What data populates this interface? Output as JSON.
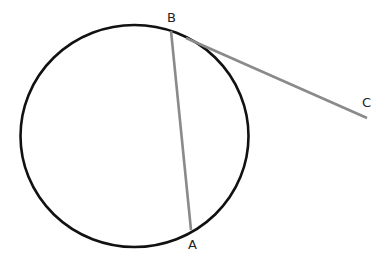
{
  "diagram": {
    "type": "geometry",
    "colors": {
      "circle_stroke": "#111111",
      "segment_stroke": "#8a8a8a",
      "label": "#222222",
      "background": "#ffffff"
    },
    "circle": {
      "cx": 134.5,
      "cy": 136,
      "rx": 114,
      "ry": 111
    },
    "points": [
      {
        "name": "B",
        "x": 171,
        "y": 31,
        "label_x": 167,
        "label_y": 22
      },
      {
        "name": "A",
        "x": 191,
        "y": 230,
        "label_x": 188,
        "label_y": 249
      },
      {
        "name": "C",
        "x": 367,
        "y": 118,
        "label_x": 362,
        "label_y": 107
      }
    ],
    "segments": [
      {
        "name": "chord-BA",
        "from": "B",
        "to": "A"
      },
      {
        "name": "tangent-BC",
        "from": "B",
        "to": "C"
      }
    ],
    "labels": {
      "B": "B",
      "A": "A",
      "C": "C"
    }
  }
}
